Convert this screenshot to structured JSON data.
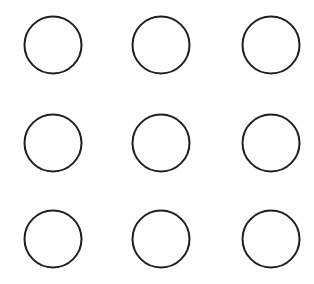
{
  "canvas": {
    "width": 314,
    "height": 284,
    "background_color": "#ffffff",
    "name": "circle-grid-canvas"
  },
  "style": {
    "stroke_color": "#1f1f1f",
    "stroke_width": 2,
    "fill_color": "none",
    "shape_kind": "circle"
  },
  "grid": {
    "rows": 3,
    "columns": 3,
    "count": 9,
    "column_centers_x": [
      53,
      161,
      271
    ],
    "row_centers_y": [
      45,
      143,
      239
    ],
    "radius": 28.5,
    "diameter": 57,
    "column_spacing": 108,
    "row_spacing": 97
  },
  "shapes": [
    {
      "id": "circle-r1-c1",
      "row": 1,
      "column": 1,
      "cx": 53,
      "cy": 45,
      "r": 28.5
    },
    {
      "id": "circle-r1-c2",
      "row": 1,
      "column": 2,
      "cx": 161,
      "cy": 45,
      "r": 28.5
    },
    {
      "id": "circle-r1-c3",
      "row": 1,
      "column": 3,
      "cx": 271,
      "cy": 45,
      "r": 28.5
    },
    {
      "id": "circle-r2-c1",
      "row": 2,
      "column": 1,
      "cx": 53,
      "cy": 143,
      "r": 28.5
    },
    {
      "id": "circle-r2-c2",
      "row": 2,
      "column": 2,
      "cx": 161,
      "cy": 143,
      "r": 28.5
    },
    {
      "id": "circle-r2-c3",
      "row": 2,
      "column": 3,
      "cx": 271,
      "cy": 143,
      "r": 28.5
    },
    {
      "id": "circle-r3-c1",
      "row": 3,
      "column": 1,
      "cx": 53,
      "cy": 239,
      "r": 28.5
    },
    {
      "id": "circle-r3-c2",
      "row": 3,
      "column": 2,
      "cx": 161,
      "cy": 239,
      "r": 28.5
    },
    {
      "id": "circle-r3-c3",
      "row": 3,
      "column": 3,
      "cx": 271,
      "cy": 239,
      "r": 28.5
    }
  ]
}
